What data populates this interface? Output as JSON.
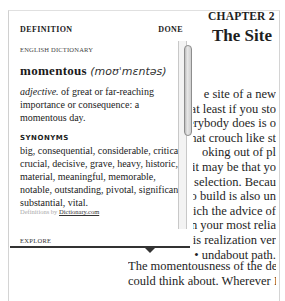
{
  "book": {
    "chapter_label": "CHAPTER 2",
    "chapter_title": "The Site",
    "visible_lines": [
      "e site of a new",
      "., at least if you sto",
      "erybody does is o",
      ": that crouch like st",
      "oking out of pl",
      "it may be that yo",
      "e selection. Becau",
      "to build is also un",
      "hich the advice of",
      "en your most relia",
      ". this realization ver",
      "• undabout path."
    ],
    "paragraph2_lines": [
      "The momentousness of the deci",
      "could think about. Wherever I put"
    ]
  },
  "popup": {
    "title": "DEFINITION",
    "done_label": "DONE",
    "source": "ENGLISH DICTIONARY",
    "headword": "momentous",
    "pronunciation": "(moʊˈmɛntəs)",
    "part_of_speech": "adjective.",
    "definition": " of great or far-reaching importance or consequence: a momentous day.",
    "synonyms_label": "SYNONYMS",
    "synonyms": "big, consequential, considerable, critical, crucial, decisive, grave, heavy, historic, material, meaningful, memorable, notable, outstanding, pivotal, significant, substantial, vital.",
    "attribution_prefix": "Definitions by ",
    "attribution_link": "Dictionary.com",
    "explore_label": "EXPLORE"
  },
  "icons": {
    "popup_arrow": "down-triangle",
    "scrollbar_thumb": "vertical-scroll-thumb"
  },
  "colors": {
    "text": "#1a1a1a",
    "popup_border": "#d0d0d0",
    "divider": "#333333",
    "attribution_text": "#aaaaaa"
  }
}
